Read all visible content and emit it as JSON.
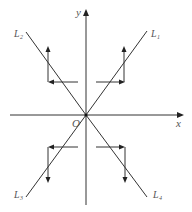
{
  "diagram": {
    "type": "coordinate-plane",
    "axes": {
      "x_label": "x",
      "y_label": "y",
      "origin_label": "O"
    },
    "lines": [
      {
        "name": "L1",
        "label_main": "L",
        "label_sub": "1",
        "quadrant": "I"
      },
      {
        "name": "L2",
        "label_main": "L",
        "label_sub": "2",
        "quadrant": "II"
      },
      {
        "name": "L3",
        "label_main": "L",
        "label_sub": "3",
        "quadrant": "III"
      },
      {
        "name": "L4",
        "label_main": "L",
        "label_sub": "4",
        "quadrant": "IV"
      }
    ],
    "arrow_paths": [
      {
        "quadrant": "I",
        "direction": "right-then-up"
      },
      {
        "quadrant": "II",
        "direction": "left-then-up"
      },
      {
        "quadrant": "III",
        "direction": "left-then-down"
      },
      {
        "quadrant": "IV",
        "direction": "right-then-down"
      }
    ],
    "colors": {
      "line": "#333333",
      "label": "#555555",
      "background": "#ffffff"
    }
  }
}
